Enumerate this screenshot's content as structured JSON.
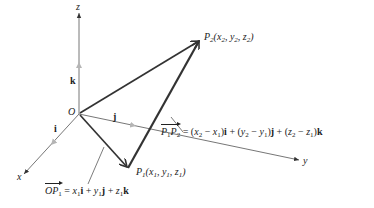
{
  "figure": {
    "axes": {
      "x_label": "x",
      "y_label": "y",
      "z_label": "z",
      "origin_label": "O"
    },
    "unit_vectors": {
      "i": "i",
      "j": "j",
      "k": "k"
    },
    "points": {
      "p1": {
        "name": "P",
        "sub": "1",
        "coords": [
          "x",
          "1",
          "y",
          "1",
          "z",
          "1"
        ],
        "text": "P1(x1, y1, z1)"
      },
      "p2": {
        "name": "P",
        "sub": "2",
        "coords": [
          "x",
          "2",
          "y",
          "2",
          "z",
          "2"
        ],
        "text": "P2(x2, y2, z2)"
      }
    },
    "equations": {
      "op1": {
        "text": "OP1 = x1i + y1j + z1k",
        "vector_name": "OP",
        "vector_sub": "1"
      },
      "p1p2": {
        "text": "P1P2 = (x2 − x1)i + (y2 − y1)j + (z2 − z1)k",
        "vector_name_a": "P",
        "sub_a": "1",
        "vector_name_b": "P",
        "sub_b": "2"
      }
    },
    "colors": {
      "vector": "#333333",
      "axis": "#555555",
      "unit_arrow": "#aaaaaa"
    }
  }
}
